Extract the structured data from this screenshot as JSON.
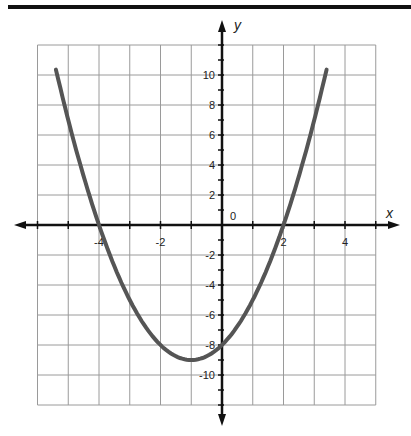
{
  "chart_data": {
    "type": "line",
    "title": "",
    "xlabel": "x",
    "ylabel": "y",
    "function": "y = x^2 + 2x - 8",
    "origin_label": "0",
    "xlim": [
      -6,
      5
    ],
    "ylim": [
      -12,
      12
    ],
    "grid": true,
    "grid_x_step": 1,
    "grid_y_step": 2,
    "x_tick_labels": [
      "-4",
      "-2",
      "2",
      "4"
    ],
    "x_tick_values": [
      -4,
      -2,
      2,
      4
    ],
    "y_tick_labels": [
      "10",
      "8",
      "6",
      "4",
      "2",
      "-2",
      "-4",
      "-6",
      "-8",
      "-10"
    ],
    "y_tick_values": [
      10,
      8,
      6,
      4,
      2,
      -2,
      -4,
      -6,
      -8,
      -10
    ],
    "series": [
      {
        "name": "parabola",
        "color": "#555555",
        "x": [
          -5.4,
          -5,
          -4.5,
          -4,
          -3.5,
          -3,
          -2.5,
          -2,
          -1.5,
          -1,
          -0.5,
          0,
          0.5,
          1,
          1.5,
          2,
          2.5,
          3,
          3.4
        ],
        "y": [
          10.36,
          7,
          3.25,
          0,
          -2.75,
          -5,
          -6.75,
          -8,
          -8.75,
          -9,
          -8.75,
          -8,
          -6.75,
          -5,
          -2.75,
          0,
          3.25,
          7,
          10.36
        ]
      }
    ],
    "key_points": {
      "x_intercepts": [
        -4,
        2
      ],
      "y_intercept": -8,
      "vertex": [
        -1,
        -9
      ]
    }
  }
}
